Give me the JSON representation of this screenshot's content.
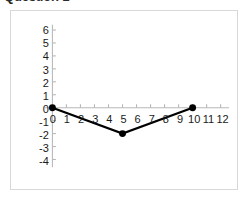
{
  "page": {
    "title": "Question 1"
  },
  "chart_data": {
    "type": "line",
    "title": "",
    "xlabel": "",
    "ylabel": "",
    "xlim": [
      -0.55,
      12.6
    ],
    "ylim": [
      -4.6,
      6.4
    ],
    "grid": false,
    "legend": false,
    "x": [
      0,
      5,
      10
    ],
    "values": [
      0,
      -2,
      0
    ],
    "points": [
      {
        "x": 0,
        "y": 0
      },
      {
        "x": 5,
        "y": -2
      },
      {
        "x": 10,
        "y": 0
      }
    ],
    "series": [
      {
        "name": "",
        "x": [
          0,
          5,
          10
        ],
        "values": [
          0,
          -2,
          0
        ]
      }
    ],
    "xticks": [
      0,
      1,
      2,
      3,
      4,
      5,
      6,
      7,
      8,
      9,
      10,
      11,
      12
    ],
    "xticklabels": [
      "0",
      "1",
      "2",
      "3",
      "4",
      "5",
      "6",
      "7",
      "8",
      "9",
      "10",
      "11",
      "12"
    ],
    "yticks": [
      6,
      5,
      4,
      3,
      2,
      1,
      0,
      -1,
      -2,
      -3,
      -4
    ],
    "yticklabels": [
      "6",
      "5",
      "4",
      "3",
      "2",
      "1",
      "0",
      "-1",
      "-2",
      "-3",
      "-4"
    ],
    "colors": {
      "line": "#000000",
      "marker": "#000000",
      "axis": "#b8b8b8",
      "tick_text": "#1a1a1a",
      "border": "#d8d8d8",
      "background": "#ffffff"
    },
    "style": {
      "line_width": 2.2,
      "marker_size": 7,
      "marker_shape": "circle"
    }
  }
}
